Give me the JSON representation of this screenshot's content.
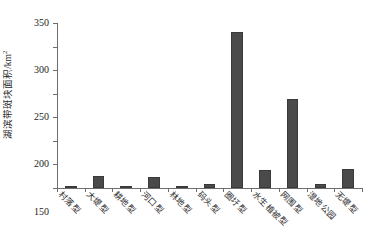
{
  "chart_data": {
    "type": "bar",
    "title": "",
    "subtitle": "",
    "xlabel": "",
    "ylabel": "湖滨带斑块面积/km²",
    "ylabel_text": "湖滨带斑块面积/km",
    "ylabel_sup": "2",
    "ylim": [
      0,
      350
    ],
    "yticks": [
      0,
      50,
      100,
      150,
      200,
      250,
      300,
      350
    ],
    "ytick_labels": [
      "0",
      "50",
      "100",
      "150",
      "200",
      "250",
      "300",
      "350"
    ],
    "grid": false,
    "legend": false,
    "legend_position": "none",
    "bar_color": "#4a4a4a",
    "axis_color": "#6e6e6e",
    "categories": [
      "村落型",
      "大堤型",
      "耕地型",
      "河口型",
      "林地型",
      "码头型",
      "圈圩型",
      "水生植被型",
      "网围型",
      "湿地公园",
      "无堤型"
    ],
    "values": [
      1,
      25,
      5,
      24,
      1,
      9,
      330,
      38,
      188,
      8,
      41
    ]
  }
}
